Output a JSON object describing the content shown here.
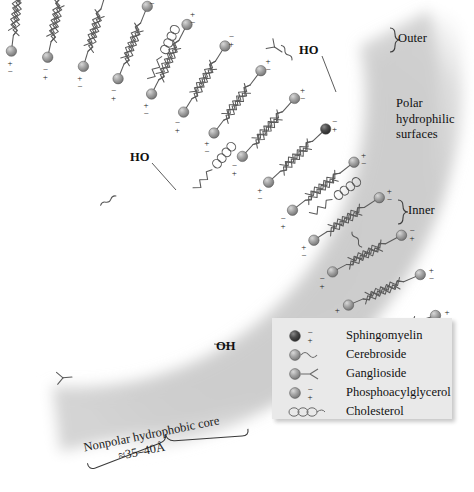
{
  "figure": {
    "labels": {
      "outer": "Outer",
      "inner": "Inner",
      "polar_surfaces": "Polar\nhydrophilic\nsurfaces",
      "polar_line1": "Polar",
      "polar_line2": "hydrophilic",
      "polar_line3": "surfaces",
      "hydroxyl_top": "HO",
      "hydroxyl_mid": "HO",
      "hydroxyl_right": "OH",
      "core_line1": "Nonpolar hydrophobic core",
      "core_line2": "≈35–40Å"
    }
  },
  "legend": {
    "items": [
      {
        "label": "Sphingomyelin",
        "icon": "sphingomyelin-head-icon",
        "head_color": "#4a4a4a",
        "charge": "±"
      },
      {
        "label": "Cerebroside",
        "icon": "cerebroside-head-icon",
        "head_color": "#9a9a9a",
        "charge": ""
      },
      {
        "label": "Ganglioside",
        "icon": "ganglioside-head-icon",
        "head_color": "#8f8f8f",
        "charge": ""
      },
      {
        "label": "Phosphoacylglycerol",
        "icon": "phosphoacylglycerol-head-icon",
        "head_color": "#969696",
        "charge": "±"
      },
      {
        "label": "Cholesterol",
        "icon": "cholesterol-ring-icon",
        "head_color": "#ffffff",
        "charge": ""
      }
    ]
  },
  "colors": {
    "background": "#ffffff",
    "membrane_fill": "#cfcfcf",
    "stroke": "#555555",
    "head_light": "#9d9d9d",
    "head_dark": "#4a4a4a",
    "legend_bg": "#e9e9e9",
    "text": "#101010"
  },
  "charges": {
    "plus": "+",
    "minus": "−"
  },
  "structure": {
    "outer_leaflet_lipids": 14,
    "inner_leaflet_lipids": 14,
    "cholesterol_molecules": 3,
    "core_thickness": "≈35–40Å"
  }
}
